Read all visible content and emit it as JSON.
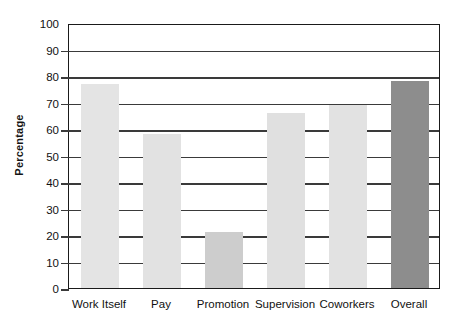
{
  "chart_data": {
    "type": "bar",
    "title": "",
    "xlabel": "",
    "ylabel": "Percentage",
    "ylim": [
      0,
      100
    ],
    "ytick_step": 10,
    "grid": true,
    "legend": "none",
    "categories": [
      "Work Itself",
      "Pay",
      "Promotion",
      "Supervision",
      "Coworkers",
      "Overall"
    ],
    "values": [
      77,
      58,
      21,
      66,
      69,
      78
    ],
    "ytick_labels": [
      "0",
      "10",
      "20",
      "30",
      "40",
      "50",
      "60",
      "70",
      "80",
      "90",
      "100"
    ],
    "bar_colors": [
      "#e4e4e4",
      "#e2e2e2",
      "#cdcdcd",
      "#e0e0e0",
      "#e2e2e2",
      "#8d8d8d"
    ]
  },
  "style": {
    "frame_color": "#1a1a1a",
    "grid_color": "#3a3a3a",
    "text_color": "#111111",
    "background": "#ffffff"
  }
}
